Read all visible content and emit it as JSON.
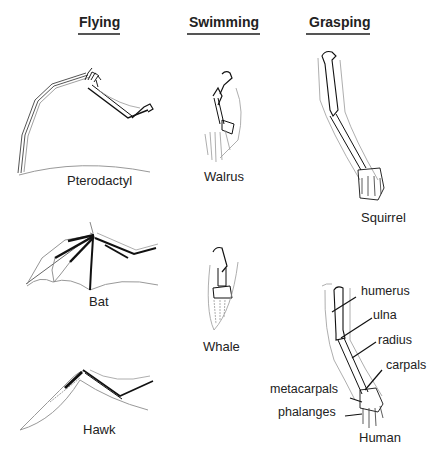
{
  "columns": [
    {
      "header": "Flying",
      "animals": [
        "Pterodactyl",
        "Bat",
        "Hawk"
      ]
    },
    {
      "header": "Swimming",
      "animals": [
        "Walrus",
        "Whale"
      ]
    },
    {
      "header": "Grasping",
      "animals": [
        "Squirrel",
        "Human"
      ]
    }
  ],
  "bone_labels": {
    "humerus": "humerus",
    "ulna": "ulna",
    "radius": "radius",
    "carpals": "carpals",
    "metacarpals": "metacarpals",
    "phalanges": "phalanges"
  },
  "colors": {
    "bone_stroke": "#111111",
    "outline_stroke": "#888888",
    "header_underline": "#555555"
  }
}
